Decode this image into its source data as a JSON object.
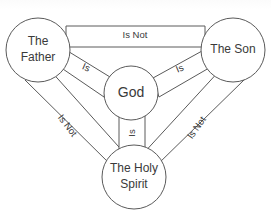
{
  "diagram": {
    "type": "relationship-diagram",
    "canvas": {
      "width": 271,
      "height": 215
    },
    "colors": {
      "background": "#ffffff",
      "stroke": "#5a5a5a",
      "text": "#3a3a3a"
    },
    "nodes": [
      {
        "id": "father",
        "label_line1": "The",
        "label_line2": "Father",
        "cx": 38,
        "cy": 50,
        "r": 32
      },
      {
        "id": "son",
        "label_line1": "The Son",
        "label_line2": "",
        "cx": 233,
        "cy": 50,
        "r": 32
      },
      {
        "id": "god",
        "label_line1": "God",
        "label_line2": "",
        "cx": 131,
        "cy": 93,
        "r": 27
      },
      {
        "id": "spirit",
        "label_line1": "The Holy",
        "label_line2": "Spirit",
        "cx": 134,
        "cy": 177,
        "r": 32
      }
    ],
    "edges": [
      {
        "id": "father-son",
        "from": "father",
        "to": "son",
        "label": "Is Not",
        "label_x": 135,
        "label_y": 35,
        "rotation": 0
      },
      {
        "id": "father-spirit",
        "from": "father",
        "to": "spirit",
        "label": "Is Not",
        "label_x": 67,
        "label_y": 126,
        "rotation": 53
      },
      {
        "id": "son-spirit",
        "from": "son",
        "to": "spirit",
        "label": "Is Not",
        "label_x": 197,
        "label_y": 128,
        "rotation": -55
      },
      {
        "id": "father-god",
        "from": "father",
        "to": "god",
        "label": "Is",
        "label_x": 86,
        "label_y": 68,
        "rotation": 23
      },
      {
        "id": "son-god",
        "from": "son",
        "to": "god",
        "label": "Is",
        "label_x": 180,
        "label_y": 69,
        "rotation": -23
      },
      {
        "id": "spirit-god",
        "from": "spirit",
        "to": "god",
        "label": "Is",
        "label_x": 132,
        "label_y": 133,
        "rotation": -90
      }
    ]
  }
}
